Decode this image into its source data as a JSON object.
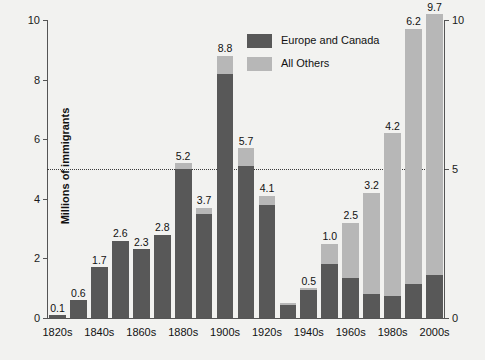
{
  "chart_data": {
    "type": "bar",
    "stacked": true,
    "title": "",
    "xlabel": "",
    "ylabel": "Millions of immigrants",
    "ylim": [
      0,
      10.5
    ],
    "yticks": [
      0,
      2,
      4,
      6,
      8,
      10
    ],
    "yticks_right": [
      0,
      5,
      10
    ],
    "grid": "dotted horizontal gridline at y=5",
    "gridline_values": [
      5
    ],
    "legend_position": "top-center-right",
    "categories": [
      "1820s",
      "1830s",
      "1840s",
      "1850s",
      "1860s",
      "1870s",
      "1880s",
      "1890s",
      "1900s",
      "1910s",
      "1920s",
      "1930s",
      "1940s",
      "1950s",
      "1960s",
      "1970s",
      "1980s",
      "1990s",
      "2000s"
    ],
    "tick_labels_shown": [
      "1820s",
      "1840s",
      "1860s",
      "1880s",
      "1900s",
      "1920s",
      "1940s",
      "1960s",
      "1980s",
      "2000s"
    ],
    "totals": [
      0.1,
      0.6,
      1.7,
      2.6,
      2.3,
      2.8,
      5.2,
      3.7,
      8.8,
      5.7,
      4.1,
      0.5,
      1.0,
      2.5,
      3.2,
      4.2,
      6.2,
      9.7,
      10.2
    ],
    "series": [
      {
        "name": "Europe and Canada",
        "color": "#585858",
        "values": [
          0.1,
          0.6,
          1.7,
          2.6,
          2.3,
          2.8,
          5.0,
          3.5,
          8.2,
          5.1,
          3.8,
          0.45,
          0.95,
          1.8,
          1.35,
          0.8,
          0.75,
          1.15,
          1.45
        ]
      },
      {
        "name": "All Others",
        "color": "#b7b7b7",
        "values": [
          0.0,
          0.0,
          0.0,
          0.0,
          0.0,
          0.0,
          0.2,
          0.2,
          0.6,
          0.6,
          0.3,
          0.05,
          0.05,
          0.7,
          1.85,
          3.4,
          5.45,
          8.55,
          8.75
        ]
      }
    ],
    "data_labels": [
      "0.1",
      "0.6",
      "1.7",
      "2.6",
      "2.3",
      "2.8",
      "5.2",
      "3.7",
      "8.8",
      "5.7",
      "4.1",
      "",
      "0.5",
      "1.0",
      "2.5",
      "3.2",
      "4.2",
      "6.2",
      "9.7",
      "10.2"
    ]
  },
  "legend": {
    "items": [
      {
        "label": "Europe and Canada",
        "color": "#585858"
      },
      {
        "label": "All Others",
        "color": "#b7b7b7"
      }
    ]
  },
  "axes": {
    "y_title": "Millions of immigrants"
  }
}
